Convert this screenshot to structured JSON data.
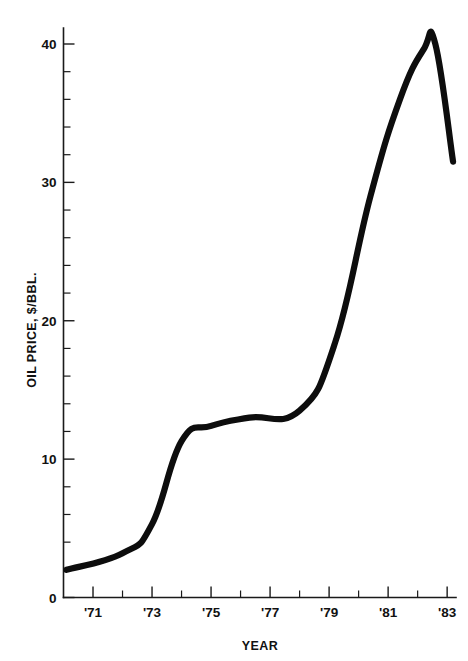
{
  "chart_data": {
    "type": "line",
    "title": "",
    "xlabel": "YEAR",
    "ylabel": "OIL PRICE, $/BBL.",
    "xlim": [
      1970,
      1983.3
    ],
    "ylim": [
      0,
      41.5
    ],
    "grid": false,
    "legend": false,
    "x_major_ticks": [
      1971,
      1973,
      1975,
      1977,
      1979,
      1981,
      1983
    ],
    "x_major_tick_labels": [
      "'71",
      "'73",
      "'75",
      "'77",
      "'79",
      "'81",
      "'83"
    ],
    "x_minor_ticks": [
      1970,
      1972,
      1974,
      1976,
      1978,
      1980,
      1982
    ],
    "y_major_ticks": [
      0,
      10,
      20,
      30,
      40
    ],
    "y_major_tick_labels": [
      "0",
      "10",
      "20",
      "30",
      "40"
    ],
    "y_minor_ticks": [
      2,
      4,
      6,
      8,
      12,
      14,
      16,
      18,
      22,
      24,
      26,
      28,
      32,
      34,
      36,
      38
    ],
    "series": [
      {
        "name": "Oil price",
        "color": "#0d0d0d",
        "x": [
          1970.1,
          1972.0,
          1973.0,
          1974.0,
          1975.0,
          1976.3,
          1978.0,
          1979.2,
          1980.4,
          1981.4,
          1982.2,
          1982.6,
          1983.2
        ],
        "values": [
          2.0,
          3.2,
          5.3,
          11.3,
          12.4,
          13.0,
          13.5,
          18.4,
          29.0,
          36.0,
          39.6,
          40.0,
          31.5
        ]
      }
    ]
  },
  "axis_labels": {
    "x_axis_title": "YEAR",
    "y_axis_title": "OIL PRICE, $/BBL."
  }
}
